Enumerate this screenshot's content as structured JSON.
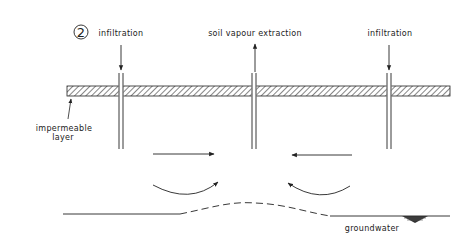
{
  "figure": {
    "panel_number": "2",
    "labels": {
      "left_well": "infiltration",
      "center_well": "soil vapour extraction",
      "right_well": "infiltration",
      "layer_line1": "impermeable",
      "layer_line2": "layer",
      "water": "groundwater"
    },
    "elements": {
      "wells": [
        {
          "name": "left-infiltration-well",
          "x": 121,
          "flow": "down"
        },
        {
          "name": "center-extraction-well",
          "x": 254,
          "flow": "up"
        },
        {
          "name": "right-infiltration-well",
          "x": 389,
          "flow": "down"
        }
      ],
      "impermeable_layer": {
        "x1": 67,
        "x2": 450,
        "y1": 86,
        "y2": 96,
        "pattern": "hatched"
      },
      "flow_arrows": [
        {
          "direction": "right",
          "y": 154
        },
        {
          "direction": "left",
          "y": 155
        }
      ],
      "curved_arrows": [
        {
          "direction": "up-right"
        },
        {
          "direction": "up-left"
        }
      ],
      "groundwater_table": {
        "style": "solid-dashed-solid",
        "mound_under_center": true
      }
    },
    "colors": {
      "line": "#222222",
      "background": "#ffffff"
    }
  }
}
